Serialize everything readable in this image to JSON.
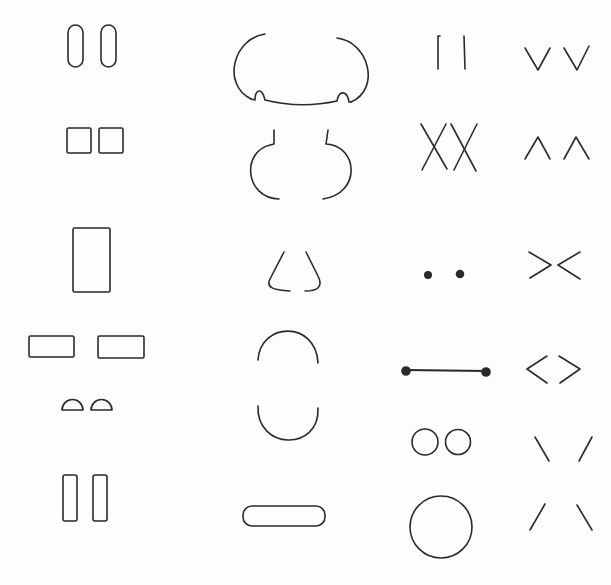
{
  "page": {
    "width": 611,
    "height": 585,
    "background": "#fdfdfc",
    "stroke_color": "#2a2a2a",
    "stroke_width": 1.6
  },
  "sketch": {
    "title": "",
    "columns": [
      {
        "id": "col-1",
        "shapes": [
          {
            "kind": "rounded-rect",
            "x": 68,
            "y": 25,
            "w": 15,
            "h": 42,
            "r": 7.5
          },
          {
            "kind": "rounded-rect",
            "x": 101,
            "y": 25,
            "w": 15,
            "h": 42,
            "r": 7.5
          },
          {
            "kind": "rect",
            "x": 67,
            "y": 128,
            "w": 24,
            "h": 25
          },
          {
            "kind": "rect",
            "x": 99,
            "y": 128,
            "w": 24,
            "h": 25
          },
          {
            "kind": "rect",
            "x": 73,
            "y": 228,
            "w": 37,
            "h": 64
          },
          {
            "kind": "rect",
            "x": 29,
            "y": 336,
            "w": 45,
            "h": 21
          },
          {
            "kind": "rect",
            "x": 98,
            "y": 336,
            "w": 46,
            "h": 22
          },
          {
            "kind": "half-disc",
            "x": 62,
            "y": 391,
            "w": 21,
            "h": 19
          },
          {
            "kind": "half-disc",
            "x": 91,
            "y": 390,
            "w": 21,
            "h": 20
          },
          {
            "kind": "rounded-rect",
            "x": 63,
            "y": 475,
            "w": 14,
            "h": 46,
            "r": 2
          },
          {
            "kind": "rounded-rect",
            "x": 93,
            "y": 475,
            "w": 14,
            "h": 46,
            "r": 2
          }
        ]
      },
      {
        "id": "col-2",
        "shapes": [
          {
            "kind": "arc-cloud-bottom",
            "x": 229,
            "y": 34,
            "w": 144,
            "h": 72
          },
          {
            "kind": "bracket-arcs",
            "x": 249,
            "y": 130,
            "w": 106,
            "h": 70
          },
          {
            "kind": "nose-triangle",
            "x": 268,
            "y": 252,
            "w": 58,
            "h": 42
          },
          {
            "kind": "arc-top",
            "x": 258,
            "y": 328,
            "w": 60,
            "h": 32
          },
          {
            "kind": "arc-bottom",
            "x": 258,
            "y": 406,
            "w": 60,
            "h": 36
          },
          {
            "kind": "capsule",
            "x": 243,
            "y": 506,
            "w": 82,
            "h": 20
          }
        ]
      },
      {
        "id": "col-3",
        "shapes": [
          {
            "kind": "vertical-bars",
            "x": 438,
            "y": 36,
            "w": 30,
            "h": 33
          },
          {
            "kind": "double-x",
            "x": 421,
            "y": 124,
            "w": 57,
            "h": 50
          },
          {
            "kind": "dots",
            "x": 425,
            "y": 270,
            "w": 40,
            "h": 10
          },
          {
            "kind": "dumbbell-line",
            "x": 402,
            "y": 366,
            "w": 88,
            "h": 10
          },
          {
            "kind": "circles-pair",
            "x": 412,
            "y": 428,
            "w": 58,
            "h": 30
          },
          {
            "kind": "circle",
            "x": 410,
            "y": 495,
            "w": 62,
            "h": 64
          }
        ]
      },
      {
        "id": "col-4",
        "shapes": [
          {
            "kind": "v-pair",
            "x": 525,
            "y": 48,
            "w": 76,
            "h": 24
          },
          {
            "kind": "caret-pair",
            "x": 525,
            "y": 137,
            "w": 76,
            "h": 24
          },
          {
            "kind": "angle-inward",
            "x": 529,
            "y": 252,
            "w": 55,
            "h": 28
          },
          {
            "kind": "angle-outward",
            "x": 527,
            "y": 356,
            "w": 56,
            "h": 28
          },
          {
            "kind": "diagonals-top",
            "x": 535,
            "y": 437,
            "w": 57,
            "h": 25
          },
          {
            "kind": "diagonals-bottom",
            "x": 530,
            "y": 504,
            "w": 62,
            "h": 27
          }
        ]
      }
    ]
  }
}
